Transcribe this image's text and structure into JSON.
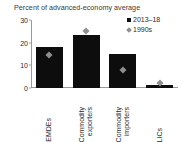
{
  "chart_data": {
    "type": "bar",
    "title": "Percent of advanced-economy average",
    "xlabel": "",
    "ylabel": "",
    "ylim": [
      0,
      30
    ],
    "yticks": [
      0,
      10,
      20,
      30
    ],
    "grid": false,
    "legend_position": "top-right",
    "categories": [
      [
        "EMDEs"
      ],
      [
        "Commodity",
        "exporters"
      ],
      [
        "Commodity",
        "importers"
      ],
      [
        "LICs"
      ]
    ],
    "category_labels": [
      "EMDEs",
      "Commodity exporters",
      "Commodity importers",
      "LICs"
    ],
    "series": [
      {
        "name": "2013–18",
        "marker": "square",
        "color": "#0d0d0d",
        "render": "bar",
        "values": [
          18,
          23.5,
          15,
          1.5
        ]
      },
      {
        "name": "1990s",
        "marker": "diamond",
        "color": "#8f8f8f",
        "render": "point",
        "values": [
          14.5,
          25,
          8,
          2
        ]
      }
    ]
  },
  "legend": {
    "items": [
      {
        "label": "2013–18",
        "icon": "filled-square-marker"
      },
      {
        "label": "1990s",
        "icon": "diamond-marker"
      }
    ]
  },
  "axis": {
    "y_tick_labels": [
      "0",
      "10",
      "20",
      "30"
    ]
  }
}
